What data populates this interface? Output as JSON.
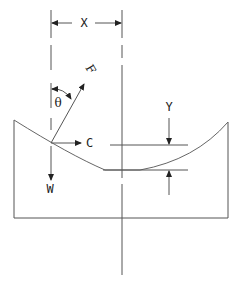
{
  "diagram": {
    "labels": {
      "x": "X",
      "y": "Y",
      "f": "F",
      "c": "C",
      "w": "W",
      "theta": "θ"
    },
    "colors": {
      "stroke": "#555555",
      "text": "#222222",
      "background": "#ffffff"
    }
  }
}
